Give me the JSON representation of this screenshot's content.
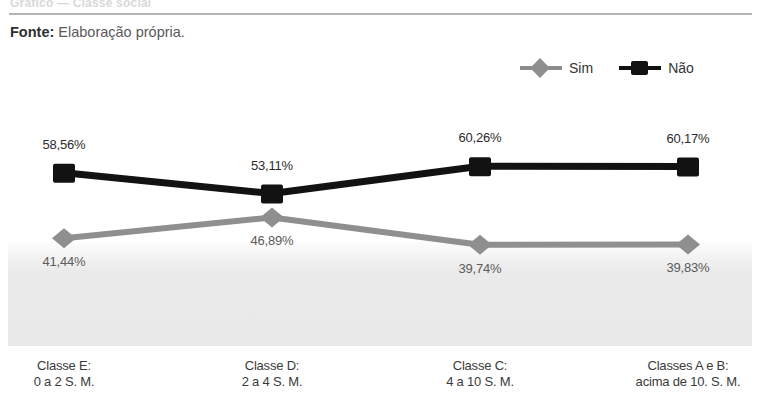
{
  "header": {
    "top_sliver": "Gráfico — Classe social",
    "source_label": "Fonte:",
    "source_value": "Elaboração própria."
  },
  "legend": {
    "items": [
      {
        "label": "Sim",
        "marker": "diamond-marker",
        "color": "#8f8f8f"
      },
      {
        "label": "Não",
        "marker": "square-marker",
        "color": "#121212"
      }
    ]
  },
  "chart_data": {
    "type": "line",
    "title": "",
    "subtitle": "",
    "xlabel": "",
    "ylabel": "",
    "ylim": [
      0,
      100
    ],
    "grid": false,
    "legend_position": "top-right",
    "categories": [
      "Classe E:\n0 a 2 S. M.",
      "Classe D:\n2 a 4 S. M.",
      "Classe C:\n4 a 10 S. M.",
      "Classes A e B:\nacima de 10. S. M."
    ],
    "category_lines": [
      {
        "line1": "Classe E:",
        "line2": "0 a 2 S. M."
      },
      {
        "line1": "Classe D:",
        "line2": "2 a 4 S. M."
      },
      {
        "line1": "Classe C:",
        "line2": "4 a 10 S. M."
      },
      {
        "line1": "Classes A e B:",
        "line2": "acima de 10. S. M."
      }
    ],
    "series": [
      {
        "name": "Não",
        "color": "#121212",
        "marker": "square",
        "values": [
          58.56,
          53.11,
          60.26,
          60.17
        ],
        "labels": [
          "58,56%",
          "53,11%",
          "60,26%",
          "60,17%"
        ]
      },
      {
        "name": "Sim",
        "color": "#8f8f8f",
        "marker": "diamond",
        "values": [
          41.44,
          46.89,
          39.74,
          39.83
        ],
        "labels": [
          "41,44%",
          "46,89%",
          "39,74%",
          "39,83%"
        ]
      }
    ]
  }
}
